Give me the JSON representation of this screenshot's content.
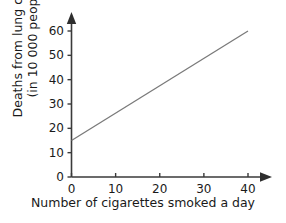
{
  "chart_data": {
    "type": "line",
    "title": "",
    "subtitle": "",
    "xlabel": "Number of cigarettes smoked a day",
    "ylabel_line1": "Deaths from lung cancer",
    "ylabel_line2": "(in 10 000 people)",
    "ylabel": "Deaths from lung cancer (in 10 000 people)",
    "xlim": [
      0,
      40
    ],
    "ylim": [
      0,
      60
    ],
    "xticks": [
      0,
      10,
      20,
      30,
      40
    ],
    "xtick_labels": [
      "0",
      "10",
      "20",
      "30",
      "40"
    ],
    "yticks": [
      0,
      10,
      20,
      30,
      40,
      50,
      60
    ],
    "ytick_labels": [
      "0",
      "10",
      "20",
      "30",
      "40",
      "50",
      "60"
    ],
    "grid": false,
    "legend": false,
    "legend_position": "none",
    "axis_arrows": true,
    "series": [
      {
        "name": "Deaths from lung cancer",
        "color": "#7a7a7a",
        "x": [
          0,
          40
        ],
        "values": [
          15,
          60
        ],
        "points": [
          {
            "x": 0,
            "y": 15
          },
          {
            "x": 10,
            "y": 26.25
          },
          {
            "x": 20,
            "y": 37.5
          },
          {
            "x": 30,
            "y": 48.75
          },
          {
            "x": 40,
            "y": 60
          }
        ]
      }
    ]
  },
  "colors": {
    "axis": "#3a3a3a",
    "line": "#7a7a7a",
    "text": "#1a1a1a",
    "background": "#ffffff"
  }
}
